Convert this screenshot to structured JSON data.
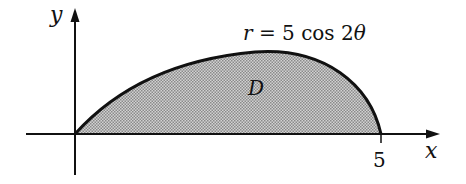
{
  "diagram": {
    "axes": {
      "x_label": "x",
      "y_label": "y",
      "x_tick_label": "5"
    },
    "curve": {
      "equation_r": "r",
      "equation_eq": "=",
      "equation_rhs": "5 cos 2",
      "equation_theta": "θ"
    },
    "region_label": "D",
    "colors": {
      "stroke": "#111111",
      "fill": "#bdbdbd"
    }
  }
}
